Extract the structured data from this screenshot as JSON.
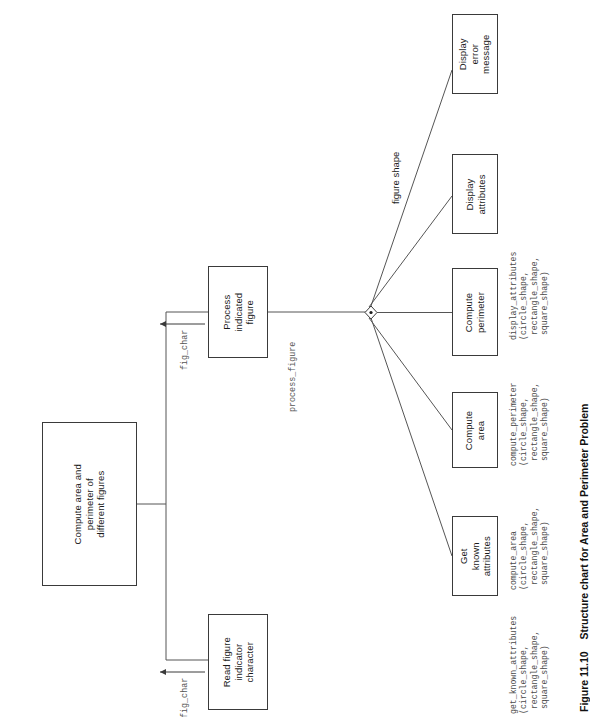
{
  "figure": {
    "caption_number": "Figure 11.10",
    "caption_text": "Structure chart for Area and Perimeter Problem",
    "orientation": "rotated-90-ccw",
    "type": "structure-chart"
  },
  "boxes": {
    "root": "Compute area and\nperimeter of\ndifferent figures",
    "read_figure": "Read figure\nindicator\ncharacter",
    "process_figure": "Process\nindicated\nfigure",
    "get_known_attributes": "Get\nknown\nattributes",
    "compute_area": "Compute\narea",
    "compute_perimeter": "Compute\nperimeter",
    "display_attributes": "Display\nattributes",
    "display_error": "Display\nerror\nmessage"
  },
  "flow_labels": {
    "fig_char_read": "fig_char",
    "fig_char_process": "fig_char",
    "process_figure_call": "process_figure",
    "figure_shape": "figure shape"
  },
  "annotations": {
    "get_known_attributes": "get_known_attributes\n(circle_shape,\n rectangle_shape,\n square_shape)",
    "compute_area": "compute_area\n(circle_shape,\n rectangle_shape,\n square_shape)",
    "compute_perimeter": "compute_perimeter\n(circle_shape,\n rectangle_shape,\n square_shape)",
    "display_attributes": "display_attributes\n(circle_shape,\n rectangle_shape,\n square_shape)"
  },
  "colors": {
    "box_border": "#3a3a3a",
    "line": "#555555",
    "text": "#1a1a1a",
    "anno_text": "#4a4a4a",
    "background": "#ffffff"
  }
}
